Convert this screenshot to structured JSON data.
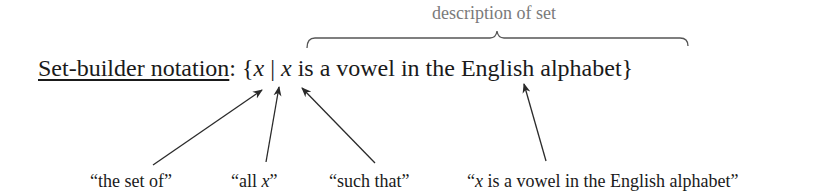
{
  "diagram": {
    "title_label": "Set-builder notation",
    "colon": ":",
    "open_brace": "{",
    "variable": "x",
    "bar": "|",
    "condition_var": "x",
    "condition_text": " is a vowel in the English alphabet",
    "close_brace": "}",
    "brace_annotation": "description of set",
    "labels": [
      {
        "text_before": "“the set of”",
        "italic": "",
        "text_after": ""
      },
      {
        "text_before": "“all ",
        "italic": "x",
        "text_after": "”"
      },
      {
        "text_before": "“such that”",
        "italic": "",
        "text_after": ""
      },
      {
        "text_before": "“",
        "italic": "x",
        "text_after": " is a vowel in the English alphabet”"
      }
    ],
    "colors": {
      "text": "#1a1a1a",
      "annotation": "#7a7a7a",
      "arrow": "#2a2a2a",
      "brace": "#555555"
    }
  }
}
